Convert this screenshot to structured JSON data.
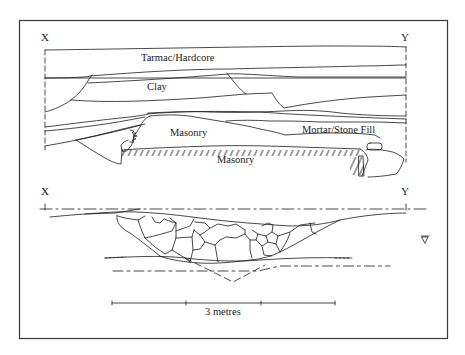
{
  "figure": {
    "type": "archaeological section drawing",
    "frame_color": "#3a3a3a",
    "line_color": "#1a1a1a"
  },
  "upper_section": {
    "name": "section elevation",
    "end_labels": {
      "left": "X",
      "right": "Y"
    },
    "layers": [
      {
        "id": "tarmac",
        "label": "Tarmac/Hardcore"
      },
      {
        "id": "clay",
        "label": "Clay"
      },
      {
        "id": "masonry_upper",
        "label": "Masonry"
      },
      {
        "id": "mortar_fill",
        "label": "Mortar/Stone Fill"
      },
      {
        "id": "masonry_lower",
        "label": "Masonry"
      }
    ]
  },
  "lower_section": {
    "name": "rubble profile",
    "end_labels": {
      "left": "X",
      "right": "Y"
    },
    "symbols": [
      {
        "id": "water-level",
        "glyph": "▽"
      }
    ]
  },
  "scale_bar": {
    "label": "3 metres",
    "divisions": 3
  }
}
